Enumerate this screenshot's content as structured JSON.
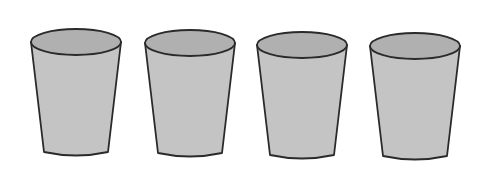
{
  "figure": {
    "cup_count": 4,
    "colors": {
      "background": "#ffffff",
      "cup_body": "#c4c4c4",
      "cup_opening": "#b0b0b0",
      "outline": "#2a2a2a"
    },
    "cups": [
      {
        "label": "cup-1"
      },
      {
        "label": "cup-2"
      },
      {
        "label": "cup-3"
      },
      {
        "label": "cup-4"
      }
    ]
  }
}
